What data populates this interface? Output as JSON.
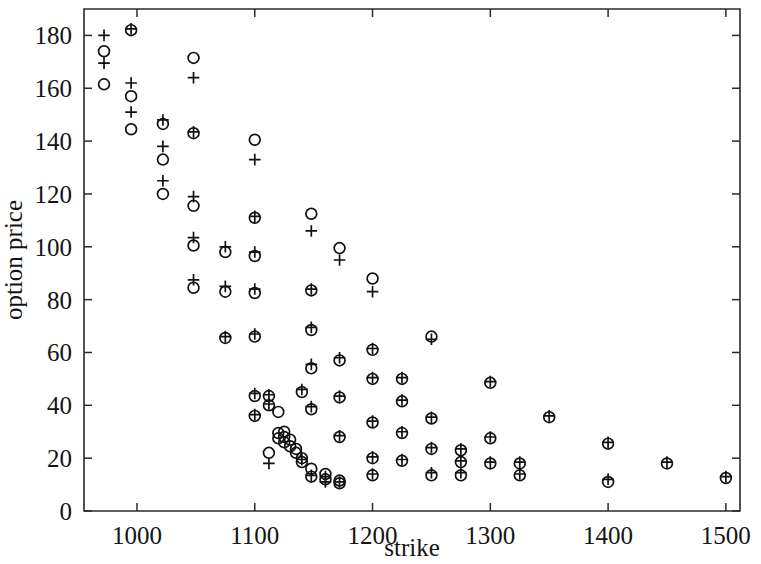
{
  "figure": {
    "title": "",
    "background_color": "#ffffff",
    "foreground_color": "#111111"
  },
  "axes": {
    "x_label": "strike",
    "y_label": "option price",
    "x_ticks": [
      "1000",
      "1100",
      "1200",
      "1300",
      "1400",
      "1500"
    ],
    "y_ticks": [
      "0",
      "20",
      "40",
      "60",
      "80",
      "100",
      "120",
      "140",
      "160",
      "180"
    ]
  },
  "chart_data": {
    "type": "scatter",
    "title": "",
    "xlabel": "strike",
    "ylabel": "option price",
    "xlim": [
      955,
      1512
    ],
    "ylim": [
      0,
      190
    ],
    "x_ticks": [
      1000,
      1100,
      1200,
      1300,
      1400,
      1500
    ],
    "y_ticks": [
      0,
      20,
      40,
      60,
      80,
      100,
      120,
      140,
      160,
      180
    ],
    "grid": false,
    "legend": null,
    "series": [
      {
        "name": "market price",
        "marker": "circle",
        "color": "#111111",
        "points": [
          [
            972,
            174.0
          ],
          [
            972,
            161.5
          ],
          [
            995,
            182.0
          ],
          [
            995,
            157.0
          ],
          [
            995,
            144.5
          ],
          [
            1022,
            146.5
          ],
          [
            1022,
            133.0
          ],
          [
            1022,
            120.0
          ],
          [
            1048,
            171.5
          ],
          [
            1048,
            143.0
          ],
          [
            1048,
            115.5
          ],
          [
            1048,
            100.5
          ],
          [
            1048,
            84.5
          ],
          [
            1075,
            98.0
          ],
          [
            1075,
            83.0
          ],
          [
            1075,
            65.5
          ],
          [
            1100,
            140.5
          ],
          [
            1100,
            111.0
          ],
          [
            1100,
            96.5
          ],
          [
            1100,
            82.5
          ],
          [
            1100,
            66.0
          ],
          [
            1100,
            43.5
          ],
          [
            1100,
            36.0
          ],
          [
            1112,
            43.5
          ],
          [
            1112,
            40.0
          ],
          [
            1112,
            22.0
          ],
          [
            1120,
            37.5
          ],
          [
            1120,
            29.5
          ],
          [
            1120,
            27.5
          ],
          [
            1125,
            30.0
          ],
          [
            1125,
            28.0
          ],
          [
            1125,
            26.0
          ],
          [
            1130,
            27.0
          ],
          [
            1130,
            24.5
          ],
          [
            1135,
            23.5
          ],
          [
            1135,
            22.0
          ],
          [
            1140,
            45.0
          ],
          [
            1140,
            20.0
          ],
          [
            1140,
            18.5
          ],
          [
            1148,
            112.5
          ],
          [
            1148,
            83.5
          ],
          [
            1148,
            68.5
          ],
          [
            1148,
            54.0
          ],
          [
            1148,
            38.5
          ],
          [
            1148,
            16.0
          ],
          [
            1148,
            13.0
          ],
          [
            1160,
            14.0
          ],
          [
            1160,
            12.0
          ],
          [
            1172,
            99.5
          ],
          [
            1172,
            57.0
          ],
          [
            1172,
            43.0
          ],
          [
            1172,
            28.0
          ],
          [
            1172,
            11.5
          ],
          [
            1172,
            10.5
          ],
          [
            1200,
            88.0
          ],
          [
            1200,
            61.0
          ],
          [
            1200,
            50.0
          ],
          [
            1200,
            33.5
          ],
          [
            1200,
            20.0
          ],
          [
            1200,
            13.5
          ],
          [
            1225,
            50.0
          ],
          [
            1225,
            41.5
          ],
          [
            1225,
            29.5
          ],
          [
            1225,
            19.0
          ],
          [
            1250,
            66.0
          ],
          [
            1250,
            35.0
          ],
          [
            1250,
            23.5
          ],
          [
            1250,
            13.5
          ],
          [
            1275,
            23.0
          ],
          [
            1275,
            18.5
          ],
          [
            1275,
            13.5
          ],
          [
            1300,
            48.5
          ],
          [
            1300,
            27.5
          ],
          [
            1300,
            18.0
          ],
          [
            1325,
            18.0
          ],
          [
            1325,
            13.5
          ],
          [
            1350,
            35.5
          ],
          [
            1400,
            25.5
          ],
          [
            1400,
            11.0
          ],
          [
            1450,
            18.0
          ],
          [
            1500,
            12.5
          ]
        ]
      },
      {
        "name": "model price",
        "marker": "plus",
        "color": "#111111",
        "points": [
          [
            972,
            180.0
          ],
          [
            972,
            169.5
          ],
          [
            995,
            182.5
          ],
          [
            995,
            162.0
          ],
          [
            995,
            151.0
          ],
          [
            1022,
            148.0
          ],
          [
            1022,
            138.0
          ],
          [
            1022,
            125.0
          ],
          [
            1048,
            164.0
          ],
          [
            1048,
            143.5
          ],
          [
            1048,
            119.0
          ],
          [
            1048,
            103.5
          ],
          [
            1048,
            87.5
          ],
          [
            1075,
            100.0
          ],
          [
            1075,
            85.0
          ],
          [
            1075,
            66.0
          ],
          [
            1100,
            133.0
          ],
          [
            1100,
            111.5
          ],
          [
            1100,
            98.0
          ],
          [
            1100,
            84.0
          ],
          [
            1100,
            67.0
          ],
          [
            1100,
            44.5
          ],
          [
            1100,
            36.5
          ],
          [
            1112,
            44.0
          ],
          [
            1112,
            40.5
          ],
          [
            1112,
            18.0
          ],
          [
            1140,
            46.0
          ],
          [
            1140,
            19.5
          ],
          [
            1148,
            106.0
          ],
          [
            1148,
            84.0
          ],
          [
            1148,
            69.5
          ],
          [
            1148,
            55.5
          ],
          [
            1148,
            39.5
          ],
          [
            1148,
            13.5
          ],
          [
            1160,
            13.0
          ],
          [
            1160,
            11.0
          ],
          [
            1172,
            95.0
          ],
          [
            1172,
            58.0
          ],
          [
            1172,
            43.5
          ],
          [
            1172,
            28.5
          ],
          [
            1172,
            11.0
          ],
          [
            1200,
            83.0
          ],
          [
            1200,
            61.5
          ],
          [
            1200,
            50.5
          ],
          [
            1200,
            34.0
          ],
          [
            1200,
            20.5
          ],
          [
            1200,
            14.0
          ],
          [
            1225,
            50.5
          ],
          [
            1225,
            42.0
          ],
          [
            1225,
            30.0
          ],
          [
            1225,
            19.5
          ],
          [
            1250,
            65.0
          ],
          [
            1250,
            35.5
          ],
          [
            1250,
            24.0
          ],
          [
            1250,
            14.5
          ],
          [
            1275,
            23.5
          ],
          [
            1275,
            19.0
          ],
          [
            1275,
            14.5
          ],
          [
            1300,
            49.0
          ],
          [
            1300,
            28.0
          ],
          [
            1300,
            18.5
          ],
          [
            1325,
            18.5
          ],
          [
            1325,
            14.0
          ],
          [
            1350,
            36.0
          ],
          [
            1400,
            26.0
          ],
          [
            1400,
            12.0
          ],
          [
            1450,
            18.5
          ],
          [
            1500,
            13.0
          ]
        ]
      }
    ]
  }
}
